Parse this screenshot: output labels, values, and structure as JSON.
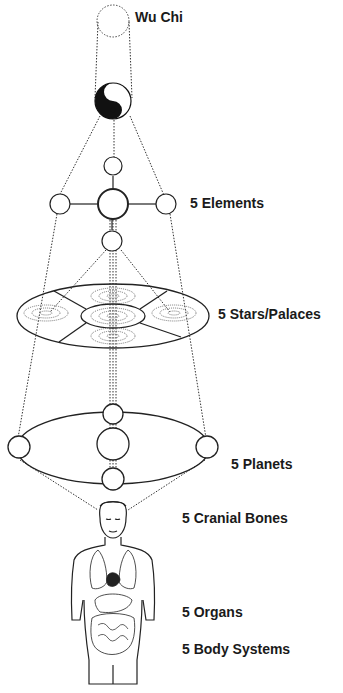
{
  "diagram": {
    "labels": {
      "wu_chi": "Wu Chi",
      "elements": "5 Elements",
      "stars": "5 Stars/Palaces",
      "planets": "5 Planets",
      "cranial": "5 Cranial Bones",
      "organs": "5 Organs",
      "body_systems": "5 Body Systems"
    },
    "colors": {
      "line": "#222222",
      "background": "#ffffff"
    }
  }
}
